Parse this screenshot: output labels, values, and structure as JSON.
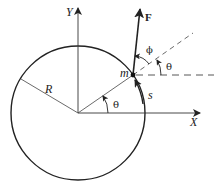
{
  "diagram": {
    "labels": {
      "y_axis": "Y",
      "x_axis": "X",
      "radius": "R",
      "mass": "m",
      "force": "F",
      "angle_phi": "ϕ",
      "angle_theta_center": "θ",
      "angle_theta_mass": "θ",
      "arc_length": "s"
    },
    "elements": [
      {
        "id": "circle",
        "kind": "circle",
        "label": "R"
      },
      {
        "id": "x-axis",
        "kind": "axis",
        "label": "X"
      },
      {
        "id": "y-axis",
        "kind": "axis",
        "label": "Y"
      },
      {
        "id": "mass",
        "kind": "point",
        "label": "m"
      },
      {
        "id": "force",
        "kind": "vector",
        "label": "F"
      },
      {
        "id": "arc-length",
        "kind": "arc-arrow",
        "label": "s"
      }
    ],
    "colors": {
      "stroke": "#222222",
      "background": "#ffffff"
    }
  }
}
